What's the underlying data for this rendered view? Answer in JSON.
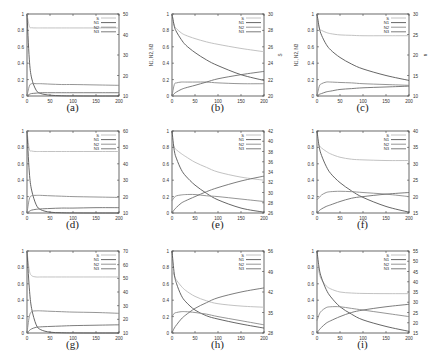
{
  "chart_data": [
    {
      "id": "a",
      "caption": "(a)",
      "type": "line",
      "x": [
        0,
        5,
        10,
        20,
        30,
        50,
        75,
        100,
        150,
        200
      ],
      "xlim": [
        0,
        200
      ],
      "xticks": [
        0,
        50,
        100,
        150,
        200
      ],
      "ylim": [
        0,
        1
      ],
      "yticks": [
        0,
        0.2,
        0.4,
        0.6,
        0.8,
        1
      ],
      "y2lim": [
        10,
        50
      ],
      "y2ticks": [
        10,
        20,
        30,
        40,
        50
      ],
      "ylabel": "",
      "y2label": "",
      "xlabel": "",
      "legend": [
        "S",
        "N1",
        "N2",
        "N3"
      ],
      "series": [
        {
          "name": "S",
          "axis": "y2",
          "values": [
            50,
            44,
            43.3,
            43.2,
            43.2,
            43.2,
            43.2,
            43.2,
            43.2,
            43.2
          ]
        },
        {
          "name": "N1",
          "axis": "y",
          "values": [
            1,
            0.45,
            0.22,
            0.07,
            0.03,
            0.01,
            0.003,
            0.001,
            0,
            0
          ]
        },
        {
          "name": "N2",
          "axis": "y",
          "values": [
            0,
            0.12,
            0.15,
            0.15,
            0.15,
            0.145,
            0.14,
            0.14,
            0.135,
            0.13
          ]
        },
        {
          "name": "N3",
          "axis": "y",
          "values": [
            0,
            0.02,
            0.03,
            0.035,
            0.04,
            0.04,
            0.04,
            0.04,
            0.04,
            0.04
          ]
        }
      ]
    },
    {
      "id": "b",
      "caption": "(b)",
      "type": "line",
      "x": [
        0,
        5,
        10,
        20,
        30,
        50,
        75,
        100,
        150,
        200
      ],
      "xlim": [
        0,
        200
      ],
      "xticks": [
        0,
        50,
        100,
        150,
        200
      ],
      "ylim": [
        0,
        1
      ],
      "yticks": [
        0,
        0.2,
        0.4,
        0.6,
        0.8,
        1
      ],
      "y2lim": [
        20,
        30
      ],
      "y2ticks": [
        20,
        22,
        24,
        26,
        28,
        30
      ],
      "ylabel": "N1, N2, N3",
      "y2label": "S",
      "xlabel": "t",
      "legend": [
        "S",
        "N1",
        "N2",
        "N3"
      ],
      "series": [
        {
          "name": "S",
          "axis": "y2",
          "values": [
            30,
            28.6,
            28.2,
            27.7,
            27.4,
            27.0,
            26.6,
            26.3,
            25.8,
            25.4
          ]
        },
        {
          "name": "N1",
          "axis": "y",
          "values": [
            1,
            0.85,
            0.78,
            0.69,
            0.62,
            0.53,
            0.44,
            0.37,
            0.26,
            0.19
          ]
        },
        {
          "name": "N2",
          "axis": "y",
          "values": [
            0,
            0.14,
            0.16,
            0.17,
            0.17,
            0.17,
            0.17,
            0.16,
            0.15,
            0.15
          ]
        },
        {
          "name": "N3",
          "axis": "y",
          "values": [
            0,
            0.03,
            0.05,
            0.08,
            0.1,
            0.13,
            0.17,
            0.21,
            0.26,
            0.3
          ]
        }
      ]
    },
    {
      "id": "c",
      "caption": "(c)",
      "type": "line",
      "x": [
        0,
        5,
        10,
        20,
        30,
        50,
        75,
        100,
        150,
        200
      ],
      "xlim": [
        0,
        200
      ],
      "xticks": [
        0,
        50,
        100,
        150,
        200
      ],
      "ylim": [
        0,
        1
      ],
      "yticks": [
        0,
        0.2,
        0.4,
        0.6,
        0.8,
        1
      ],
      "y2lim": [
        10,
        30
      ],
      "y2ticks": [
        10,
        15,
        20,
        25,
        30
      ],
      "ylabel": "N1, N2, N3",
      "y2label": "n",
      "xlabel": "t",
      "legend": [
        "S",
        "N1",
        "N2",
        "N3"
      ],
      "series": [
        {
          "name": "S",
          "axis": "y2",
          "values": [
            30,
            26.5,
            26.0,
            25.5,
            25.2,
            24.9,
            24.8,
            24.7,
            24.7,
            24.7
          ]
        },
        {
          "name": "N1",
          "axis": "y",
          "values": [
            1,
            0.83,
            0.74,
            0.63,
            0.56,
            0.47,
            0.39,
            0.33,
            0.25,
            0.19
          ]
        },
        {
          "name": "N2",
          "axis": "y",
          "values": [
            0,
            0.12,
            0.15,
            0.17,
            0.17,
            0.165,
            0.16,
            0.15,
            0.14,
            0.13
          ]
        },
        {
          "name": "N3",
          "axis": "y",
          "values": [
            0,
            0.02,
            0.03,
            0.05,
            0.06,
            0.08,
            0.09,
            0.1,
            0.11,
            0.12
          ]
        }
      ]
    },
    {
      "id": "d",
      "caption": "(d)",
      "type": "line",
      "x": [
        0,
        5,
        10,
        20,
        30,
        50,
        75,
        100,
        150,
        200
      ],
      "xlim": [
        0,
        200
      ],
      "xticks": [
        0,
        50,
        100,
        150,
        200
      ],
      "ylim": [
        0,
        1
      ],
      "yticks": [
        0,
        0.2,
        0.4,
        0.6,
        0.8,
        1
      ],
      "y2lim": [
        10,
        60
      ],
      "y2ticks": [
        10,
        20,
        30,
        40,
        50,
        60
      ],
      "ylabel": "",
      "y2label": "",
      "xlabel": "",
      "legend": [
        "S",
        "N1",
        "N2",
        "N3"
      ],
      "series": [
        {
          "name": "S",
          "axis": "y2",
          "values": [
            60,
            49,
            47.8,
            47.5,
            47.5,
            47.5,
            47.5,
            47.5,
            47.5,
            47.5
          ]
        },
        {
          "name": "N1",
          "axis": "y",
          "values": [
            1,
            0.5,
            0.28,
            0.1,
            0.04,
            0.01,
            0.003,
            0.001,
            0,
            0
          ]
        },
        {
          "name": "N2",
          "axis": "y",
          "values": [
            0,
            0.17,
            0.21,
            0.215,
            0.215,
            0.21,
            0.205,
            0.2,
            0.195,
            0.19
          ]
        },
        {
          "name": "N3",
          "axis": "y",
          "values": [
            0,
            0.02,
            0.035,
            0.045,
            0.05,
            0.055,
            0.06,
            0.06,
            0.065,
            0.065
          ]
        }
      ]
    },
    {
      "id": "e",
      "caption": "(e)",
      "type": "line",
      "x": [
        0,
        5,
        10,
        20,
        30,
        50,
        75,
        100,
        150,
        200
      ],
      "xlim": [
        0,
        200
      ],
      "xticks": [
        0,
        50,
        100,
        150,
        200
      ],
      "ylim": [
        0,
        1
      ],
      "yticks": [
        0,
        0.2,
        0.4,
        0.6,
        0.8,
        1
      ],
      "y2lim": [
        26,
        42
      ],
      "y2ticks": [
        26,
        28,
        30,
        32,
        34,
        36,
        38,
        40,
        42
      ],
      "ylabel": "",
      "y2label": "",
      "xlabel": "",
      "legend": [
        "S",
        "N1",
        "N2",
        "N3"
      ],
      "series": [
        {
          "name": "S",
          "axis": "y2",
          "values": [
            40,
            38.8,
            38.3,
            37.6,
            37.0,
            35.9,
            34.9,
            34.0,
            33.0,
            32.4
          ]
        },
        {
          "name": "N1",
          "axis": "y",
          "values": [
            1,
            0.76,
            0.66,
            0.53,
            0.45,
            0.34,
            0.24,
            0.16,
            0.06,
            0.01
          ]
        },
        {
          "name": "N2",
          "axis": "y",
          "values": [
            0.15,
            0.19,
            0.21,
            0.22,
            0.225,
            0.225,
            0.21,
            0.2,
            0.17,
            0.14
          ]
        },
        {
          "name": "N3",
          "axis": "y",
          "values": [
            0,
            0.04,
            0.07,
            0.12,
            0.15,
            0.2,
            0.26,
            0.31,
            0.39,
            0.45
          ]
        }
      ]
    },
    {
      "id": "f",
      "caption": "(f)",
      "type": "line",
      "x": [
        0,
        5,
        10,
        20,
        30,
        50,
        75,
        100,
        150,
        200
      ],
      "xlim": [
        0,
        200
      ],
      "xticks": [
        0,
        50,
        100,
        150,
        200
      ],
      "ylim": [
        0,
        1
      ],
      "yticks": [
        0,
        0.2,
        0.4,
        0.6,
        0.8,
        1
      ],
      "y2lim": [
        15,
        40
      ],
      "y2ticks": [
        15,
        20,
        25,
        30,
        35,
        40
      ],
      "ylabel": "",
      "y2label": "",
      "xlabel": "",
      "legend": [
        "S",
        "N1",
        "N2",
        "N3"
      ],
      "series": [
        {
          "name": "S",
          "axis": "y2",
          "values": [
            37,
            35.5,
            34.8,
            33.8,
            33.0,
            32.0,
            31.4,
            31.2,
            31.0,
            31.0
          ]
        },
        {
          "name": "N1",
          "axis": "y",
          "values": [
            1,
            0.8,
            0.7,
            0.57,
            0.48,
            0.37,
            0.27,
            0.19,
            0.08,
            0.01
          ]
        },
        {
          "name": "N2",
          "axis": "y",
          "values": [
            0.16,
            0.19,
            0.22,
            0.25,
            0.26,
            0.265,
            0.26,
            0.25,
            0.23,
            0.2
          ]
        },
        {
          "name": "N3",
          "axis": "y",
          "values": [
            0,
            0.03,
            0.05,
            0.08,
            0.1,
            0.14,
            0.18,
            0.2,
            0.23,
            0.25
          ]
        }
      ]
    },
    {
      "id": "g",
      "caption": "(g)",
      "type": "line",
      "x": [
        0,
        5,
        10,
        20,
        30,
        50,
        75,
        100,
        150,
        200
      ],
      "xlim": [
        0,
        200
      ],
      "xticks": [
        0,
        50,
        100,
        150,
        200
      ],
      "ylim": [
        0,
        1
      ],
      "yticks": [
        0,
        0.2,
        0.4,
        0.6,
        0.8,
        1
      ],
      "y2lim": [
        10,
        70
      ],
      "y2ticks": [
        10,
        20,
        30,
        40,
        50,
        60,
        70
      ],
      "ylabel": "",
      "y2label": "",
      "xlabel": "",
      "legend": [
        "S",
        "N1",
        "N2",
        "N3"
      ],
      "series": [
        {
          "name": "S",
          "axis": "y2",
          "values": [
            70,
            56,
            52,
            51,
            51,
            51,
            51,
            51,
            51,
            51
          ]
        },
        {
          "name": "N1",
          "axis": "y",
          "values": [
            1,
            0.55,
            0.3,
            0.1,
            0.04,
            0.01,
            0.003,
            0.001,
            0,
            0
          ]
        },
        {
          "name": "N2",
          "axis": "y",
          "values": [
            0,
            0.2,
            0.26,
            0.27,
            0.27,
            0.265,
            0.26,
            0.255,
            0.25,
            0.24
          ]
        },
        {
          "name": "N3",
          "axis": "y",
          "values": [
            0,
            0.03,
            0.05,
            0.07,
            0.075,
            0.08,
            0.085,
            0.09,
            0.095,
            0.1
          ]
        }
      ]
    },
    {
      "id": "h",
      "caption": "(h)",
      "type": "line",
      "x": [
        0,
        5,
        10,
        20,
        30,
        50,
        75,
        100,
        150,
        200
      ],
      "xlim": [
        0,
        200
      ],
      "xticks": [
        0,
        50,
        100,
        150,
        200
      ],
      "ylim": [
        0,
        1
      ],
      "yticks": [
        0,
        0.2,
        0.4,
        0.6,
        0.8,
        1
      ],
      "y2lim": [
        28,
        56
      ],
      "y2ticks": [
        28,
        35,
        42,
        49,
        56
      ],
      "ylabel": "",
      "y2label": "",
      "xlabel": "",
      "legend": [
        "S",
        "N1",
        "N2",
        "N3"
      ],
      "series": [
        {
          "name": "S",
          "axis": "y2",
          "values": [
            50,
            47.5,
            46,
            44,
            42.5,
            40.5,
            39.0,
            38.0,
            37.2,
            36.8
          ]
        },
        {
          "name": "N1",
          "axis": "y",
          "values": [
            1,
            0.72,
            0.6,
            0.46,
            0.38,
            0.28,
            0.21,
            0.17,
            0.11,
            0.06
          ]
        },
        {
          "name": "N2",
          "axis": "y",
          "values": [
            0.2,
            0.24,
            0.25,
            0.26,
            0.26,
            0.25,
            0.23,
            0.2,
            0.15,
            0.1
          ]
        },
        {
          "name": "N3",
          "axis": "y",
          "values": [
            0,
            0.06,
            0.1,
            0.17,
            0.22,
            0.3,
            0.37,
            0.43,
            0.5,
            0.55
          ]
        }
      ]
    },
    {
      "id": "i",
      "caption": "(i)",
      "type": "line",
      "x": [
        0,
        5,
        10,
        20,
        30,
        50,
        75,
        100,
        150,
        200
      ],
      "xlim": [
        0,
        200
      ],
      "xticks": [
        0,
        50,
        100,
        150,
        200
      ],
      "ylim": [
        0,
        1
      ],
      "yticks": [
        0,
        0.2,
        0.4,
        0.6,
        0.8,
        1
      ],
      "y2lim": [
        15,
        55
      ],
      "y2ticks": [
        15,
        20,
        25,
        30,
        35,
        40,
        45,
        50,
        55
      ],
      "ylabel": "",
      "y2label": "",
      "xlabel": "",
      "legend": [
        "S",
        "N1",
        "N2",
        "N3"
      ],
      "series": [
        {
          "name": "S",
          "axis": "y2",
          "values": [
            50,
            44,
            41,
            38,
            36.5,
            35.0,
            34.5,
            34.3,
            34.2,
            34.2
          ]
        },
        {
          "name": "N1",
          "axis": "y",
          "values": [
            1,
            0.78,
            0.67,
            0.53,
            0.44,
            0.32,
            0.23,
            0.16,
            0.08,
            0.02
          ]
        },
        {
          "name": "N2",
          "axis": "y",
          "values": [
            0.15,
            0.23,
            0.27,
            0.31,
            0.32,
            0.32,
            0.3,
            0.28,
            0.24,
            0.2
          ]
        },
        {
          "name": "N3",
          "axis": "y",
          "values": [
            0,
            0.04,
            0.07,
            0.12,
            0.15,
            0.2,
            0.25,
            0.28,
            0.32,
            0.35
          ]
        }
      ]
    }
  ],
  "style": {
    "colors": {
      "S": "#bbbbbb",
      "N1": "#555555",
      "N2": "#8a8a8a",
      "N3": "#6e6e6e",
      "axis": "#444444",
      "text": "#333333"
    }
  }
}
